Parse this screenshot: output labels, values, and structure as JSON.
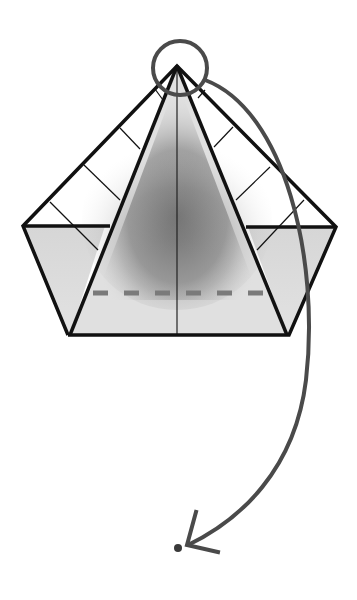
{
  "diagram": {
    "type": "origami-fold-step",
    "colors": {
      "background": "#ffffff",
      "outline": "#111111",
      "paper_light": "#dcdcdc",
      "paper_white": "#ffffff",
      "shadow": "#6e6e6e",
      "arrow": "#4a4a4a",
      "valley_fold_dash": "#7a7a7a"
    },
    "shapes": {
      "apex": [
        177,
        66
      ],
      "left_corner": [
        23,
        226
      ],
      "right_corner": [
        336,
        227
      ],
      "bottom_left": [
        68,
        335
      ],
      "bottom_right": [
        289,
        335
      ],
      "inner_left_base": [
        70,
        335
      ],
      "inner_right_base": [
        287,
        335
      ],
      "center_line_x": 177,
      "horizontal_edge_y": 226
    },
    "annotations": {
      "highlight_circle": {
        "cx": 180,
        "cy": 68,
        "r": 27,
        "label": "point to fold"
      },
      "valley_fold_line": {
        "y": 293,
        "x1": 93,
        "x2": 265,
        "dash_count": 6
      },
      "fold_arrow": {
        "from": [
          213,
          80
        ],
        "to": [
          187,
          545
        ],
        "direction": "down"
      },
      "target_dot": [
        178,
        548
      ]
    }
  }
}
